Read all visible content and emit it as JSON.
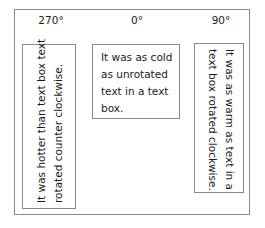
{
  "labels": {
    "left": "270°",
    "middle": "0°",
    "right": "90°"
  },
  "boxes": {
    "left": {
      "line1": "It was hotter than text box text",
      "line2": "rotated counter clockwise."
    },
    "middle": {
      "line1": "It was as cold",
      "line2": "as unrotated",
      "line3": "text in a text",
      "line4": "box."
    },
    "right": {
      "line1": "It was as warm as text in a",
      "line2": "text box rotated clockwise."
    }
  }
}
